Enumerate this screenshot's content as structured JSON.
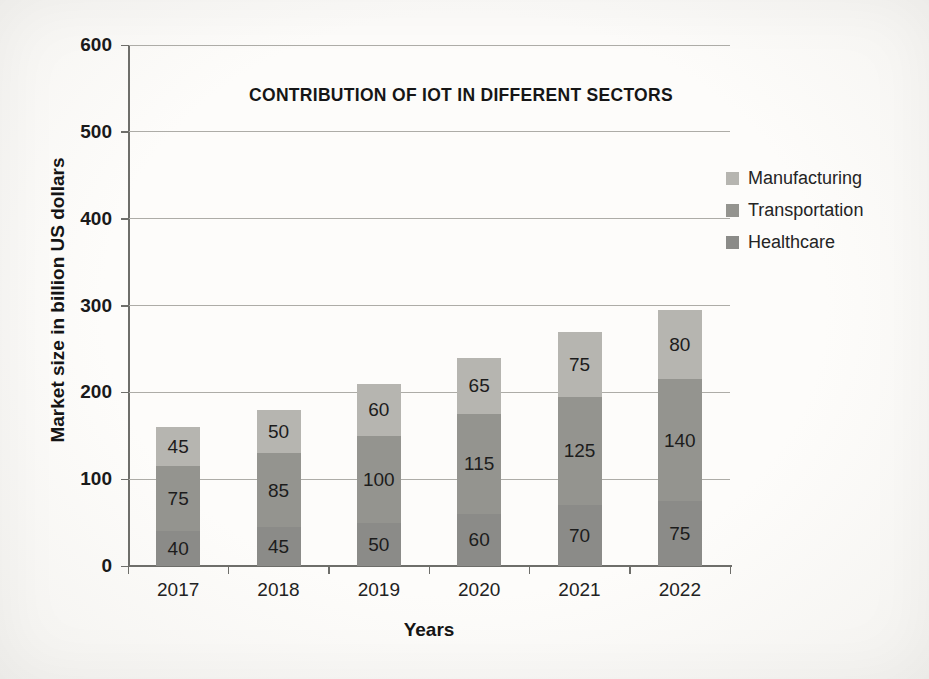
{
  "chart_data": {
    "type": "bar",
    "stacked": true,
    "title": "CONTRIBUTION OF IOT IN DIFFERENT SECTORS",
    "xlabel": "Years",
    "ylabel": "Market size in billion US dollars",
    "categories": [
      "2017",
      "2018",
      "2019",
      "2020",
      "2021",
      "2022"
    ],
    "series": [
      {
        "name": "Healthcare",
        "color": "#8b8b88",
        "values": [
          40,
          45,
          50,
          60,
          70,
          75
        ]
      },
      {
        "name": "Transportation",
        "color": "#94948f",
        "values": [
          75,
          85,
          100,
          115,
          125,
          140
        ]
      },
      {
        "name": "Manufacturing",
        "color": "#b6b5b0",
        "values": [
          45,
          50,
          60,
          65,
          75,
          80
        ]
      }
    ],
    "legend_order": [
      "Manufacturing",
      "Transportation",
      "Healthcare"
    ],
    "legend_position": "right",
    "ylim": [
      0,
      600
    ],
    "yticks": [
      0,
      100,
      200,
      300,
      400,
      500,
      600
    ],
    "grid": true
  }
}
